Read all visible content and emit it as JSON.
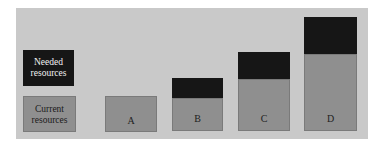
{
  "legend": {
    "needed": {
      "line1": "Needed",
      "line2": "resources",
      "color": "#161616"
    },
    "current": {
      "line1": "Current",
      "line2": "resources",
      "color": "#8f8f8f"
    }
  },
  "bars": [
    {
      "label": "A",
      "current": 1.0,
      "needed": 0.0
    },
    {
      "label": "B",
      "current": 0.9,
      "needed": 0.55
    },
    {
      "label": "C",
      "current": 1.45,
      "needed": 0.75
    },
    {
      "label": "D",
      "current": 2.15,
      "needed": 1.0
    }
  ],
  "background_color": "#c9c9c9"
}
